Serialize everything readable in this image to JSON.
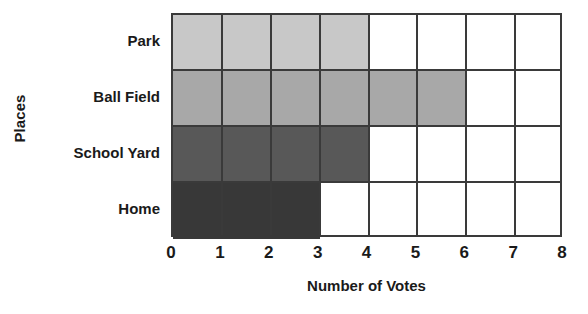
{
  "chart_data": {
    "type": "bar",
    "orientation": "horizontal",
    "title": "",
    "xlabel": "Number of Votes",
    "ylabel": "Places",
    "categories": [
      "Park",
      "Ball Field",
      "School Yard",
      "Home"
    ],
    "values": [
      4,
      6,
      4,
      3
    ],
    "colors": [
      "#c8c8c8",
      "#a8a8a8",
      "#585858",
      "#383838"
    ],
    "xlim": [
      0,
      8
    ],
    "xticks": [
      "0",
      "1",
      "2",
      "3",
      "4",
      "5",
      "6",
      "7",
      "8"
    ],
    "grid": true,
    "legend": "none",
    "grid_line_color": "#3a3a3a",
    "background": "#ffffff"
  }
}
